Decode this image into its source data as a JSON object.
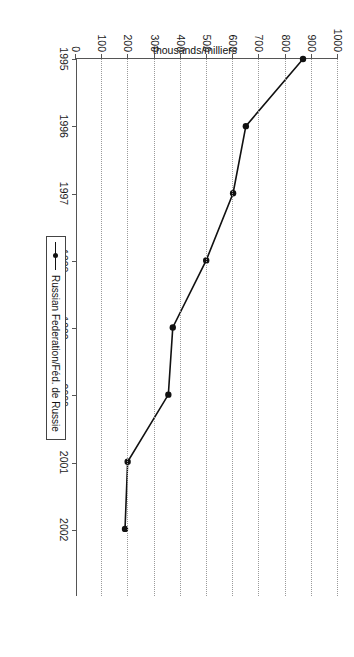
{
  "title": {
    "line1": "Inflows of foreign population to Russian Federation, 1995-2003",
    "line2": "Arrivées de population étrangère en Fédération de Russie, 1995-2003"
  },
  "legend": {
    "entry": "Russian Federation/Féd. de Russie",
    "marker_icon": "line-with-dot-marker-icon"
  },
  "chart_data": {
    "type": "line",
    "title": "Inflows of foreign population to Russian Federation, 1995-2003",
    "subtitle": "Arrivées de population étrangère en Fédération de Russie, 1995-2003",
    "orientation": "rotated-90-clockwise",
    "xlabel": "",
    "ylabel": "thousands/milliers",
    "xlim": [
      1995,
      2003
    ],
    "ylim": [
      0,
      1000
    ],
    "grid": true,
    "grid_axis": "y",
    "legend_position": "bottom-right",
    "x": [
      1995,
      1996,
      1997,
      1998,
      1999,
      2000,
      2001,
      2002
    ],
    "xticks": [
      "1995",
      "1996",
      "1997",
      "1998",
      "1999",
      "2000",
      "2001",
      "2002"
    ],
    "yticks": [
      "0",
      "100",
      "200",
      "300",
      "400",
      "500",
      "600",
      "700",
      "800",
      "900",
      "1000"
    ],
    "series": [
      {
        "name": "Russian Federation/Féd. de Russie",
        "color": "#111111",
        "marker": "circle",
        "values": [
          866,
          647,
          598,
          495,
          367,
          350,
          194,
          184
        ]
      }
    ]
  }
}
